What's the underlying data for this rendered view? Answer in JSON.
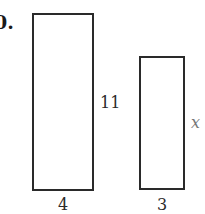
{
  "problem": {
    "number_label": "0."
  },
  "figures": [
    {
      "name": "large-rectangle",
      "width_label": "4",
      "height_label": "11"
    },
    {
      "name": "small-rectangle",
      "width_label": "3",
      "height_label": "x"
    }
  ],
  "colors": {
    "stroke": "#2a2a2a",
    "variable": "#777777",
    "background": "#ffffff"
  }
}
